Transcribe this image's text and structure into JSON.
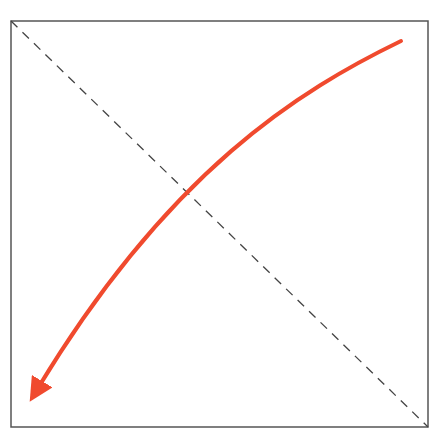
{
  "diagram": {
    "type": "schematic-arrow-plot",
    "frame": {
      "x": 11,
      "y": 21,
      "width": 417,
      "height": 406,
      "stroke": "#555555"
    },
    "diagonal": {
      "x1": 11,
      "y1": 21,
      "x2": 428,
      "y2": 427,
      "stroke": "#444444",
      "dash": "9,7"
    },
    "curve": {
      "start": [
        401,
        41
      ],
      "control1": [
        300,
        90
      ],
      "control2": [
        170,
        170
      ],
      "end": [
        38,
        388
      ],
      "stroke": "#f04a2e",
      "arrowhead": "at-end",
      "direction": "upper-right to lower-left"
    },
    "colors": {
      "accent": "#f04a2e",
      "frame": "#555555",
      "dashed": "#444444",
      "background": "#ffffff"
    }
  }
}
